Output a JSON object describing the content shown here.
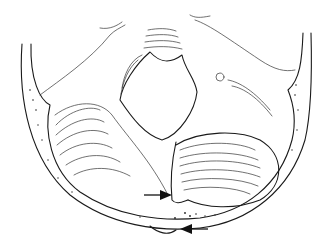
{
  "figure": {
    "type": "anatomical line illustration",
    "background": "#ffffff",
    "line_color": "#1a1a1a",
    "annotations": [
      {
        "kind": "arrow",
        "direction": "right",
        "x1": 144,
        "y1": 195,
        "x2": 170,
        "y2": 195
      },
      {
        "kind": "arrow",
        "direction": "left",
        "x1": 208,
        "y1": 229,
        "x2": 182,
        "y2": 229
      }
    ]
  }
}
